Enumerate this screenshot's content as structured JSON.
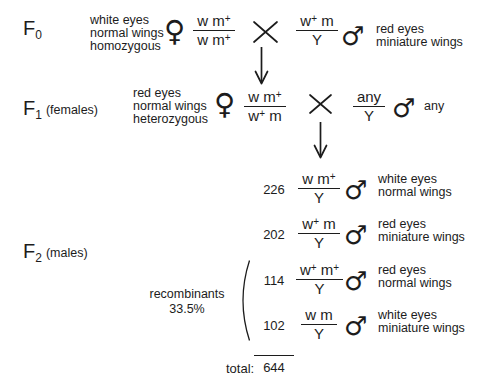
{
  "figure": {
    "kind": "genetic cross diagram",
    "ink_color": "#1c1c1c",
    "background": "#ffffff"
  },
  "symbols": {
    "female": "♀",
    "male": "♂"
  },
  "generations": {
    "f0": {
      "label": "F",
      "subscript": "0",
      "suffix": "",
      "female": {
        "phenotype": [
          "white eyes",
          "normal wings",
          "homozygous"
        ],
        "genotype": {
          "num": "w m^+",
          "den": "w m^+"
        }
      },
      "male": {
        "genotype": {
          "num": "w^+ m",
          "den": "Y"
        },
        "phenotype": [
          "red eyes",
          "miniature wings"
        ]
      }
    },
    "f1": {
      "label": "F",
      "subscript": "1",
      "suffix": "(females)",
      "female": {
        "phenotype": [
          "red eyes",
          "normal wings",
          "heterozygous"
        ],
        "genotype": {
          "num": "w m^+",
          "den": "w^+ m"
        }
      },
      "male": {
        "genotype": {
          "num": "any",
          "den": "Y"
        },
        "phenotype": [
          "any"
        ]
      }
    },
    "f2": {
      "label": "F",
      "subscript": "2",
      "suffix": "(males)",
      "rows": [
        {
          "count": "226",
          "genotype": {
            "num": "w m^+",
            "den": "Y"
          },
          "phenotype": [
            "white eyes",
            "normal wings"
          ],
          "recombinant": false
        },
        {
          "count": "202",
          "genotype": {
            "num": "w^+ m",
            "den": "Y"
          },
          "phenotype": [
            "red eyes",
            "miniature wings"
          ],
          "recombinant": false
        },
        {
          "count": "114",
          "genotype": {
            "num": "w^+ m^+",
            "den": "Y"
          },
          "phenotype": [
            "red eyes",
            "normal wings"
          ],
          "recombinant": true
        },
        {
          "count": "102",
          "genotype": {
            "num": "w m",
            "den": "Y"
          },
          "phenotype": [
            "white eyes",
            "miniature wings"
          ],
          "recombinant": true
        }
      ],
      "recombinants": {
        "label": "recombinants",
        "percent": "33.5%"
      }
    }
  },
  "total": {
    "label": "total:",
    "value": "644"
  }
}
